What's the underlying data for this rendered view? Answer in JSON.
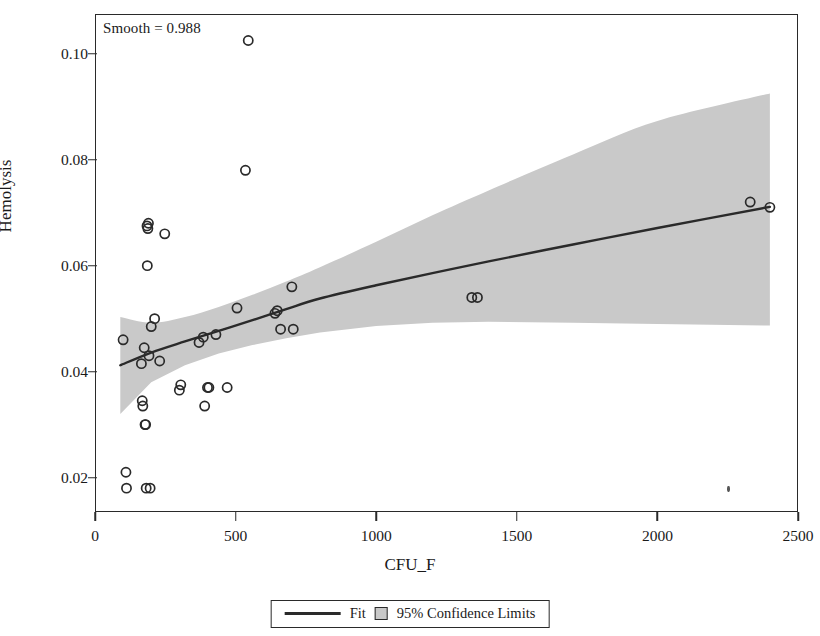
{
  "chart_data": {
    "type": "scatter",
    "title": "",
    "annotation": "Smooth = 0.988",
    "xlabel": "CFU_F",
    "ylabel": "Hemolysis",
    "xlim": [
      0,
      2500
    ],
    "ylim": [
      0.0135,
      0.1075
    ],
    "xticks": [
      0,
      500,
      1000,
      1500,
      2000,
      2500
    ],
    "yticks": [
      0.02,
      0.04,
      0.06,
      0.08,
      0.1
    ],
    "ytick_labels": [
      "0.02",
      "0.04",
      "0.06",
      "0.08",
      "0.10"
    ],
    "xtick_labels": [
      "0",
      "500",
      "1000",
      "1500",
      "2000",
      "2500"
    ],
    "grid": false,
    "legend_position": "bottom-center",
    "legend": [
      {
        "label": "Fit",
        "marker": "line",
        "color": "#2a2a2a"
      },
      {
        "label": "95% Confidence Limits",
        "marker": "square",
        "color": "#c9c9c9"
      }
    ],
    "series": [
      {
        "name": "Observations",
        "type": "scatter",
        "marker": "open-circle",
        "color": "#2a2a2a",
        "points": [
          [
            100,
            0.046
          ],
          [
            110,
            0.021
          ],
          [
            112,
            0.018
          ],
          [
            165,
            0.0415
          ],
          [
            168,
            0.0345
          ],
          [
            170,
            0.0335
          ],
          [
            175,
            0.0445
          ],
          [
            178,
            0.03
          ],
          [
            180,
            0.03
          ],
          [
            182,
            0.018
          ],
          [
            196,
            0.018
          ],
          [
            185,
            0.0675
          ],
          [
            190,
            0.068
          ],
          [
            188,
            0.067
          ],
          [
            186,
            0.06
          ],
          [
            192,
            0.043
          ],
          [
            200,
            0.0485
          ],
          [
            212,
            0.05
          ],
          [
            230,
            0.042
          ],
          [
            248,
            0.066
          ],
          [
            300,
            0.0365
          ],
          [
            305,
            0.0375
          ],
          [
            370,
            0.0455
          ],
          [
            385,
            0.0465
          ],
          [
            390,
            0.0335
          ],
          [
            400,
            0.037
          ],
          [
            405,
            0.037
          ],
          [
            430,
            0.047
          ],
          [
            470,
            0.037
          ],
          [
            505,
            0.052
          ],
          [
            535,
            0.078
          ],
          [
            545,
            0.1025
          ],
          [
            640,
            0.051
          ],
          [
            648,
            0.0515
          ],
          [
            660,
            0.048
          ],
          [
            700,
            0.056
          ],
          [
            705,
            0.048
          ],
          [
            1340,
            0.054
          ],
          [
            1360,
            0.054
          ],
          [
            2330,
            0.072
          ],
          [
            2400,
            0.071
          ]
        ]
      },
      {
        "name": "Fit",
        "type": "line",
        "color": "#2a2a2a",
        "points": [
          [
            90,
            0.0412
          ],
          [
            200,
            0.0436
          ],
          [
            320,
            0.0457
          ],
          [
            440,
            0.0477
          ],
          [
            560,
            0.0497
          ],
          [
            680,
            0.0518
          ],
          [
            800,
            0.0538
          ],
          [
            1000,
            0.0563
          ],
          [
            1200,
            0.0586
          ],
          [
            1400,
            0.0608
          ],
          [
            1700,
            0.064
          ],
          [
            2000,
            0.0671
          ],
          [
            2400,
            0.0711
          ]
        ]
      },
      {
        "name": "95% Confidence Limits",
        "type": "band",
        "color": "#c9c9c9",
        "upper": [
          [
            90,
            0.0503
          ],
          [
            200,
            0.0492
          ],
          [
            320,
            0.0503
          ],
          [
            440,
            0.0522
          ],
          [
            560,
            0.0545
          ],
          [
            680,
            0.057
          ],
          [
            800,
            0.0597
          ],
          [
            1000,
            0.0645
          ],
          [
            1200,
            0.0695
          ],
          [
            1400,
            0.0742
          ],
          [
            1700,
            0.081
          ],
          [
            2000,
            0.0873
          ],
          [
            2400,
            0.0925
          ]
        ],
        "lower": [
          [
            90,
            0.032
          ],
          [
            200,
            0.038
          ],
          [
            320,
            0.0412
          ],
          [
            440,
            0.0434
          ],
          [
            560,
            0.045
          ],
          [
            680,
            0.0463
          ],
          [
            800,
            0.0474
          ],
          [
            1000,
            0.0486
          ],
          [
            1200,
            0.0492
          ],
          [
            1400,
            0.0494
          ],
          [
            1700,
            0.0492
          ],
          [
            2000,
            0.049
          ],
          [
            2400,
            0.0487
          ]
        ]
      }
    ]
  }
}
